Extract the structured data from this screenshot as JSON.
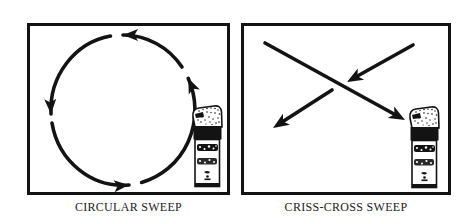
{
  "canvas": {
    "background": "#ffffff",
    "ink_color": "#131313"
  },
  "panels": [
    {
      "caption": "CIRCULAR SWEEP",
      "diagram": "circular-sweep-pattern",
      "motion_direction": "counterclockwise",
      "arrowheads": 4,
      "icon": "spray-can-icon"
    },
    {
      "caption": "CRISS-CROSS SWEEP",
      "diagram": "criss-cross-sweep-pattern",
      "arrowheads": 3,
      "icon": "spray-can-icon"
    }
  ]
}
